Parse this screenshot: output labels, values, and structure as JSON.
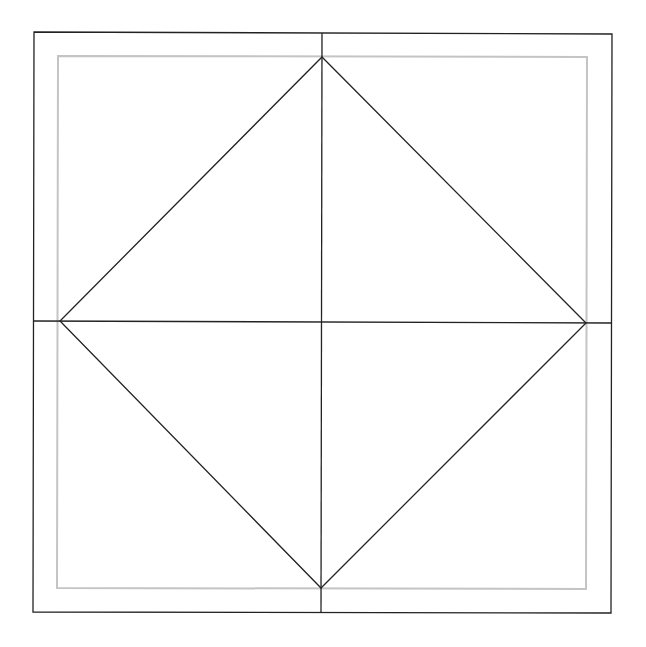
{
  "canvas": {
    "width": 646,
    "height": 647,
    "background": "#ffffff"
  },
  "colors": {
    "stroke": "#222222",
    "inner": "#c4c4c4"
  },
  "outer_square": {
    "points": [
      [
        34,
        32
      ],
      [
        612,
        34
      ],
      [
        611,
        613
      ],
      [
        33,
        612
      ]
    ]
  },
  "inner_square": {
    "points": [
      [
        58,
        56
      ],
      [
        587,
        57
      ],
      [
        586,
        589
      ],
      [
        57,
        588
      ]
    ]
  },
  "vertical_line": {
    "x1": 322,
    "y1": 33,
    "x2": 321,
    "y2": 613
  },
  "horizontal_line": {
    "x1": 34,
    "y1": 321,
    "x2": 612,
    "y2": 323
  },
  "diamond": {
    "points": [
      [
        322,
        57
      ],
      [
        586,
        323
      ],
      [
        321,
        588
      ],
      [
        60,
        321
      ]
    ]
  }
}
